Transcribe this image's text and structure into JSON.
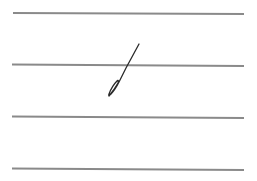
{
  "canvas": {
    "width": 257,
    "height": 181,
    "background": "#ffffff"
  },
  "ruled_lines": {
    "color": "#8a8a8a",
    "thickness": 2,
    "x_start": 12,
    "x_end": 244,
    "y_positions": [
      13,
      65,
      117,
      169
    ]
  },
  "stroke": {
    "color": "#2a2a2a",
    "description": "single handwritten stroke, diagonal with small loop at bottom"
  }
}
